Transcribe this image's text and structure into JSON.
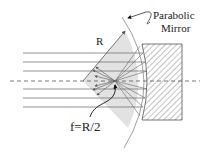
{
  "labels": {
    "parabolic": "Parabolic",
    "mirror": "Mirror",
    "radius": "R",
    "focal_length": "f=R/2"
  },
  "colors": {
    "line": "#555555",
    "sector_fill": "#e2e2e2",
    "hatch": "#666666",
    "text": "#222222"
  },
  "geometry": {
    "optical_axis_y": 81,
    "focus": [
      115,
      81
    ],
    "incoming_ray_ys": [
      53,
      62,
      71,
      89,
      98,
      107
    ],
    "mirror_block": {
      "x": 142,
      "y": 44,
      "width": 40,
      "height": 76
    }
  }
}
